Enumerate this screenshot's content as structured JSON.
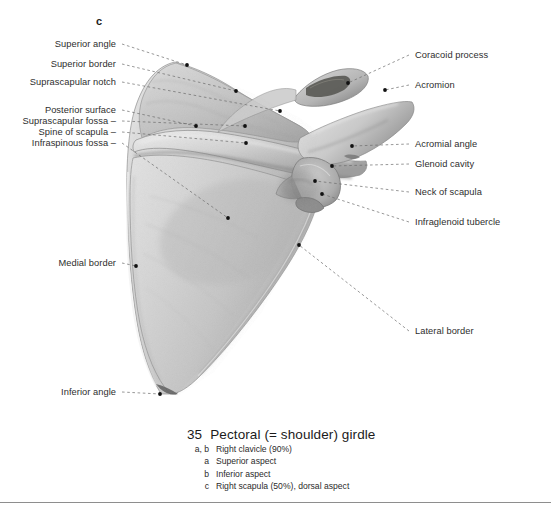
{
  "figure": {
    "letter": "c"
  },
  "labels_left": [
    {
      "text": "Superior angle",
      "x": 116,
      "y": 44,
      "dot": [
        187,
        65
      ],
      "bend": null
    },
    {
      "text": "Superior border",
      "x": 116,
      "y": 64,
      "dot": [
        236,
        91
      ],
      "bend": null
    },
    {
      "text": "Suprascapular notch",
      "x": 116,
      "y": 82,
      "dot": [
        280,
        111
      ],
      "bend": null
    },
    {
      "text": "Posterior surface",
      "x": 116,
      "y": 110,
      "dot": [
        196,
        126
      ],
      "bend": null
    },
    {
      "text": "Suprascapular fossa –",
      "x": 116,
      "y": 121,
      "dot": [
        245,
        126
      ],
      "bend": null
    },
    {
      "text": "Spine of scapula –",
      "x": 116,
      "y": 132,
      "dot": [
        246,
        143
      ],
      "bend": null
    },
    {
      "text": "Infraspinous fossa –",
      "x": 116,
      "y": 143,
      "dot": [
        228,
        218
      ],
      "bend": null
    },
    {
      "text": "Medial border",
      "x": 116,
      "y": 263,
      "dot": [
        136,
        266
      ],
      "bend": null
    },
    {
      "text": "Inferior angle",
      "x": 116,
      "y": 392,
      "dot": [
        160,
        394
      ],
      "bend": null
    }
  ],
  "labels_right": [
    {
      "text": "Coracoid process",
      "x": 415,
      "y": 55,
      "dot": [
        348,
        83
      ]
    },
    {
      "text": "Acromion",
      "x": 415,
      "y": 85,
      "dot": [
        385,
        90
      ]
    },
    {
      "text": "Acromial angle",
      "x": 415,
      "y": 144,
      "dot": [
        352,
        146
      ]
    },
    {
      "text": "Glenoid cavity",
      "x": 415,
      "y": 164,
      "dot": [
        332,
        166
      ]
    },
    {
      "text": "Neck of scapula",
      "x": 415,
      "y": 192,
      "dot": [
        315,
        181
      ]
    },
    {
      "text": "Infraglenoid tubercle",
      "x": 415,
      "y": 222,
      "dot": [
        322,
        194
      ]
    },
    {
      "text": "Lateral border",
      "x": 415,
      "y": 331,
      "dot": [
        299,
        245
      ]
    }
  ],
  "caption": {
    "number": "35",
    "title": "Pectoral (= shoulder) girdle",
    "rows": [
      {
        "key": "a, b",
        "text": "Right clavicle (90%)"
      },
      {
        "key": "a",
        "text": "Superior aspect"
      },
      {
        "key": "b",
        "text": "Inferior aspect"
      },
      {
        "key": "c",
        "text": "Right scapula (50%), dorsal aspect"
      }
    ]
  },
  "colors": {
    "page_background": "#ffffff",
    "bone_light": "#dcdcdc",
    "bone_mid": "#c4c4c4",
    "bone_shadow": "#9a9a9a",
    "bone_dark": "#6f6f6f",
    "leader_line": "#6b6b6b",
    "dot": "#111111",
    "text": "#2e2e2e",
    "rule": "#8e8e8e"
  }
}
